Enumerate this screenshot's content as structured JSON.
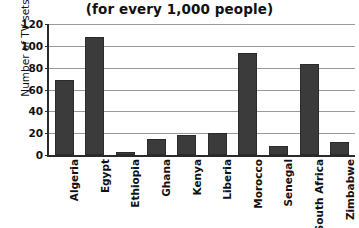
{
  "chart_data": {
    "type": "bar",
    "title": "(for every 1,000 people)",
    "xlabel": "",
    "ylabel": "Number of TV sets",
    "ylim": [
      0,
      120
    ],
    "ytick_values": [
      0,
      20,
      40,
      60,
      80,
      100,
      120
    ],
    "ytick_labels": [
      "0",
      "20",
      "40",
      "60",
      "80",
      "100",
      "120"
    ],
    "grid": true,
    "legend": false,
    "bar_color": "#3b3b3b",
    "categories": [
      "Algeria",
      "Egypt",
      "Ethiopia",
      "Ghana",
      "Kenya",
      "Liberia",
      "Morocco",
      "Senegal",
      "South Africa",
      "Zimbabwe"
    ],
    "values": [
      69,
      108,
      3,
      15,
      18,
      20,
      93,
      8,
      83,
      12
    ]
  }
}
